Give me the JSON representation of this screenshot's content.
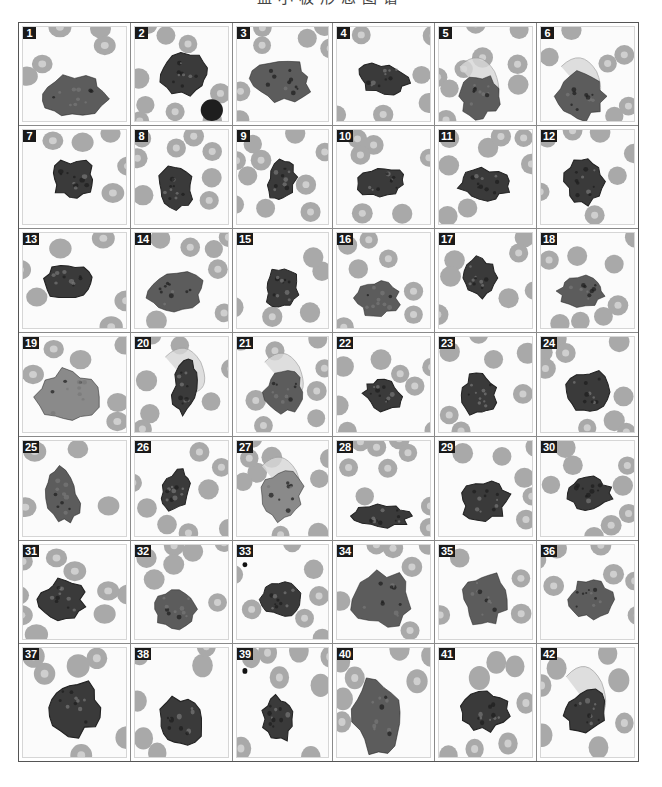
{
  "figure": {
    "title": "血小板形态图谱",
    "columns": 6,
    "rows": 7,
    "colors": {
      "rbc": "#a9a9a9",
      "rbc_center": "#cfcfcf",
      "cell_dark": "#3a3a3a",
      "cell_mid": "#5c5c5c",
      "background": "#fbfbfb",
      "badge": "#1a1a1a"
    },
    "panels": [
      {
        "n": "1",
        "cx": 45,
        "cy": 70,
        "rx": 30,
        "ry": 22,
        "rot": -10,
        "tone": "mid"
      },
      {
        "n": "2",
        "cx": 50,
        "cy": 48,
        "rx": 24,
        "ry": 20,
        "rot": 0,
        "tone": "dark",
        "extra": "lymph"
      },
      {
        "n": "3",
        "cx": 45,
        "cy": 55,
        "rx": 30,
        "ry": 22,
        "rot": 5,
        "tone": "mid"
      },
      {
        "n": "4",
        "cx": 45,
        "cy": 52,
        "rx": 25,
        "ry": 15,
        "rot": 10,
        "tone": "dark"
      },
      {
        "n": "5",
        "cx": 40,
        "cy": 70,
        "rx": 20,
        "ry": 22,
        "rot": 0,
        "tone": "mid",
        "extra": "wisp"
      },
      {
        "n": "6",
        "cx": 40,
        "cy": 70,
        "rx": 24,
        "ry": 24,
        "rot": 0,
        "tone": "mid",
        "extra": "wisp"
      },
      {
        "n": "7",
        "cx": 45,
        "cy": 50,
        "rx": 20,
        "ry": 20,
        "rot": 0,
        "tone": "dark"
      },
      {
        "n": "8",
        "cx": 40,
        "cy": 58,
        "rx": 18,
        "ry": 22,
        "rot": -10,
        "tone": "dark"
      },
      {
        "n": "9",
        "cx": 45,
        "cy": 52,
        "rx": 14,
        "ry": 22,
        "rot": 15,
        "tone": "dark"
      },
      {
        "n": "10",
        "cx": 45,
        "cy": 52,
        "rx": 24,
        "ry": 16,
        "rot": -5,
        "tone": "dark"
      },
      {
        "n": "11",
        "cx": 45,
        "cy": 55,
        "rx": 25,
        "ry": 16,
        "rot": 5,
        "tone": "dark"
      },
      {
        "n": "12",
        "cx": 43,
        "cy": 52,
        "rx": 20,
        "ry": 24,
        "rot": 0,
        "tone": "dark"
      },
      {
        "n": "13",
        "cx": 40,
        "cy": 48,
        "rx": 22,
        "ry": 18,
        "rot": -10,
        "tone": "dark"
      },
      {
        "n": "14",
        "cx": 40,
        "cy": 60,
        "rx": 28,
        "ry": 20,
        "rot": -10,
        "tone": "mid"
      },
      {
        "n": "15",
        "cx": 45,
        "cy": 55,
        "rx": 18,
        "ry": 20,
        "rot": 0,
        "tone": "dark"
      },
      {
        "n": "16",
        "cx": 40,
        "cy": 65,
        "rx": 22,
        "ry": 18,
        "rot": 0,
        "tone": "mid"
      },
      {
        "n": "17",
        "cx": 40,
        "cy": 45,
        "rx": 16,
        "ry": 20,
        "rot": 0,
        "tone": "dark"
      },
      {
        "n": "18",
        "cx": 40,
        "cy": 58,
        "rx": 24,
        "ry": 15,
        "rot": 0,
        "tone": "mid"
      },
      {
        "n": "19",
        "cx": 40,
        "cy": 60,
        "rx": 28,
        "ry": 28,
        "rot": 0,
        "tone": "light"
      },
      {
        "n": "20",
        "cx": 50,
        "cy": 50,
        "rx": 12,
        "ry": 28,
        "rot": 10,
        "tone": "dark",
        "extra": "wisp"
      },
      {
        "n": "21",
        "cx": 48,
        "cy": 55,
        "rx": 20,
        "ry": 22,
        "rot": 0,
        "tone": "mid",
        "extra": "wisp"
      },
      {
        "n": "22",
        "cx": 45,
        "cy": 58,
        "rx": 20,
        "ry": 15,
        "rot": 20,
        "tone": "dark"
      },
      {
        "n": "23",
        "cx": 40,
        "cy": 58,
        "rx": 18,
        "ry": 22,
        "rot": 0,
        "tone": "dark"
      },
      {
        "n": "24",
        "cx": 45,
        "cy": 55,
        "rx": 22,
        "ry": 22,
        "rot": 0,
        "tone": "dark"
      },
      {
        "n": "25",
        "cx": 35,
        "cy": 55,
        "rx": 15,
        "ry": 28,
        "rot": -10,
        "tone": "mid"
      },
      {
        "n": "26",
        "cx": 40,
        "cy": 50,
        "rx": 14,
        "ry": 22,
        "rot": 25,
        "tone": "dark"
      },
      {
        "n": "27",
        "cx": 45,
        "cy": 55,
        "rx": 22,
        "ry": 26,
        "rot": 0,
        "tone": "light",
        "extra": "wisp"
      },
      {
        "n": "28",
        "cx": 45,
        "cy": 75,
        "rx": 28,
        "ry": 12,
        "rot": 0,
        "tone": "dark"
      },
      {
        "n": "29",
        "cx": 45,
        "cy": 60,
        "rx": 24,
        "ry": 20,
        "rot": -15,
        "tone": "dark"
      },
      {
        "n": "30",
        "cx": 48,
        "cy": 52,
        "rx": 22,
        "ry": 16,
        "rot": 0,
        "tone": "dark"
      },
      {
        "n": "31",
        "cx": 35,
        "cy": 55,
        "rx": 20,
        "ry": 20,
        "rot": 0,
        "tone": "dark"
      },
      {
        "n": "32",
        "cx": 40,
        "cy": 65,
        "rx": 22,
        "ry": 20,
        "rot": 0,
        "tone": "mid"
      },
      {
        "n": "33",
        "cx": 45,
        "cy": 55,
        "rx": 20,
        "ry": 18,
        "rot": 0,
        "tone": "dark",
        "extra": "dot"
      },
      {
        "n": "34",
        "cx": 45,
        "cy": 55,
        "rx": 30,
        "ry": 28,
        "rot": 0,
        "tone": "mid"
      },
      {
        "n": "35",
        "cx": 45,
        "cy": 55,
        "rx": 22,
        "ry": 28,
        "rot": 0,
        "tone": "mid"
      },
      {
        "n": "36",
        "cx": 48,
        "cy": 55,
        "rx": 22,
        "ry": 20,
        "rot": 0,
        "tone": "mid"
      },
      {
        "n": "37",
        "cx": 45,
        "cy": 52,
        "rx": 24,
        "ry": 24,
        "rot": 0,
        "tone": "dark"
      },
      {
        "n": "38",
        "cx": 45,
        "cy": 65,
        "rx": 22,
        "ry": 22,
        "rot": 10,
        "tone": "dark"
      },
      {
        "n": "39",
        "cx": 42,
        "cy": 62,
        "rx": 16,
        "ry": 20,
        "rot": 0,
        "tone": "dark",
        "extra": "dot"
      },
      {
        "n": "40",
        "cx": 40,
        "cy": 60,
        "rx": 25,
        "ry": 32,
        "rot": -10,
        "tone": "mid"
      },
      {
        "n": "41",
        "cx": 45,
        "cy": 55,
        "rx": 24,
        "ry": 18,
        "rot": -5,
        "tone": "dark"
      },
      {
        "n": "42",
        "cx": 45,
        "cy": 55,
        "rx": 22,
        "ry": 18,
        "rot": -10,
        "tone": "dark",
        "extra": "wisp"
      }
    ]
  }
}
